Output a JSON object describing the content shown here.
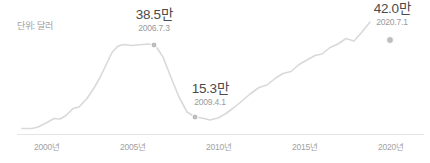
{
  "unit_label": "단위: 달러",
  "colors": {
    "line": "#d9d9d9",
    "axis": "#e4e4e4",
    "marker": "#bdbdbd",
    "value_text": "#4a4a4a",
    "muted_text": "#9a9a9a",
    "background": "#ffffff"
  },
  "annotations": {
    "peak": {
      "value": "38.5만",
      "date": "2006.7.3"
    },
    "trough": {
      "value": "15.3만",
      "date": "2009.4.1"
    },
    "end": {
      "value": "42.0만",
      "date": "2020.7.1"
    }
  },
  "x_ticks": [
    {
      "label": "2000년",
      "x": 47
    },
    {
      "label": "2005년",
      "x": 133
    },
    {
      "label": "2010년",
      "x": 219
    },
    {
      "label": "2015년",
      "x": 305
    },
    {
      "label": "2020년",
      "x": 391
    }
  ],
  "chart_data": {
    "type": "line",
    "title": "",
    "subtitle": "",
    "xlabel": "",
    "ylabel": "단위: 달러",
    "unit": "만 달러",
    "grid": false,
    "legend": null,
    "xlim": [
      1999.0,
      2020.6
    ],
    "ylim": [
      0,
      45
    ],
    "axis_baseline_y": 134,
    "x_tick_labels": [
      "2000년",
      "2005년",
      "2010년",
      "2015년",
      "2020년"
    ],
    "x_tick_values": [
      2000,
      2005,
      2010,
      2015,
      2020
    ],
    "series": [
      {
        "name": "가격",
        "color": "#d9d9d9",
        "x": [
          1999.0,
          1999.6,
          2000.0,
          2000.5,
          2001.0,
          2001.4,
          2001.8,
          2002.2,
          2002.6,
          2003.0,
          2003.4,
          2003.8,
          2004.2,
          2004.6,
          2005.0,
          2005.4,
          2005.8,
          2006.1,
          2006.5,
          2006.8,
          2007.2,
          2007.6,
          2008.0,
          2008.4,
          2008.8,
          2009.25,
          2009.7,
          2010.2,
          2010.7,
          2011.2,
          2011.7,
          2012.2,
          2012.8,
          2013.4,
          2014.0,
          2014.6,
          2015.2,
          2015.8,
          2016.3,
          2016.8,
          2017.3,
          2017.8,
          2018.3,
          2018.8,
          2019.3,
          2019.8,
          2020.2,
          2020.5
        ],
        "y": [
          4.2,
          4.2,
          4.4,
          5.6,
          6.6,
          6.5,
          7.4,
          9.2,
          9.6,
          12.0,
          14.8,
          17.6,
          21.0,
          24.4,
          26.2,
          30.6,
          33.6,
          35.2,
          36.0,
          36.6,
          36.2,
          33.0,
          27.4,
          22.0,
          18.0,
          15.3,
          15.0,
          14.4,
          14.9,
          16.2,
          17.8,
          19.6,
          21.6,
          23.4,
          24.0,
          25.8,
          27.2,
          27.8,
          29.6,
          30.8,
          32.0,
          32.4,
          34.2,
          35.2,
          36.8,
          36.2,
          38.8,
          42.0
        ]
      }
    ],
    "markers": [
      {
        "name": "peak",
        "x": 2006.5,
        "y": 38.5,
        "label": "38.5만",
        "date": "2006.7.3"
      },
      {
        "name": "trough",
        "x": 2009.25,
        "y": 15.3,
        "label": "15.3만",
        "date": "2009.4.1"
      },
      {
        "name": "end",
        "x": 2020.5,
        "y": 42.0,
        "label": "42.0만",
        "date": "2020.7.1"
      }
    ]
  }
}
